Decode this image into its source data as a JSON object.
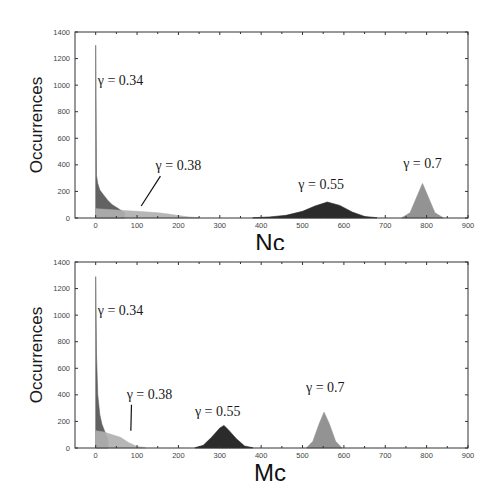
{
  "chart_data": [
    {
      "type": "area",
      "title": "",
      "xlabel": "Nc",
      "ylabel": "Occurrences",
      "xlim": [
        -50,
        900
      ],
      "ylim": [
        0,
        1400
      ],
      "xticks": [
        0,
        100,
        200,
        300,
        400,
        500,
        600,
        700,
        800,
        900
      ],
      "yticks": [
        0,
        200,
        400,
        600,
        800,
        1000,
        1200,
        1400
      ],
      "grid": false,
      "legend": "none",
      "series": [
        {
          "name": "γ = 0.34",
          "color": "#555555",
          "x": [
            0,
            2,
            5,
            10,
            20,
            30,
            40,
            50,
            60,
            70
          ],
          "values": [
            1300,
            320,
            260,
            210,
            170,
            130,
            100,
            80,
            60,
            40
          ]
        },
        {
          "name": "γ = 0.38",
          "color": "#b0b0b0",
          "x": [
            0,
            25,
            50,
            75,
            100,
            125,
            150,
            175,
            200,
            225,
            250
          ],
          "values": [
            70,
            65,
            60,
            55,
            50,
            45,
            40,
            30,
            18,
            8,
            2
          ]
        },
        {
          "name": "γ = 0.55",
          "color": "#1a1a1a",
          "x": [
            380,
            420,
            460,
            500,
            530,
            560,
            590,
            620,
            650,
            680
          ],
          "values": [
            2,
            8,
            20,
            50,
            90,
            120,
            95,
            45,
            12,
            2
          ]
        },
        {
          "name": "γ = 0.7",
          "color": "#8a8a8a",
          "x": [
            740,
            760,
            775,
            790,
            805,
            820,
            840
          ],
          "values": [
            2,
            40,
            150,
            260,
            150,
            40,
            2
          ]
        }
      ],
      "annotations": [
        {
          "text": "γ = 0.34",
          "x": 60,
          "y": 1000
        },
        {
          "text": "γ = 0.38",
          "x": 200,
          "y": 360,
          "arrow_to": [
            110,
            90
          ]
        },
        {
          "text": "γ = 0.55",
          "x": 545,
          "y": 220
        },
        {
          "text": "γ = 0.7",
          "x": 790,
          "y": 380
        }
      ]
    },
    {
      "type": "area",
      "title": "",
      "xlabel": "Mc",
      "ylabel": "Occurrences",
      "xlim": [
        -50,
        900
      ],
      "ylim": [
        0,
        1400
      ],
      "xticks": [
        0,
        100,
        200,
        300,
        400,
        500,
        600,
        700,
        800,
        900
      ],
      "yticks": [
        0,
        200,
        400,
        600,
        800,
        1000,
        1200,
        1400
      ],
      "grid": false,
      "legend": "none",
      "series": [
        {
          "name": "γ = 0.34",
          "color": "#555555",
          "x": [
            0,
            2,
            5,
            10,
            15,
            20,
            25,
            30
          ],
          "values": [
            1290,
            700,
            400,
            250,
            180,
            140,
            100,
            60
          ]
        },
        {
          "name": "γ = 0.38",
          "color": "#b0b0b0",
          "x": [
            0,
            20,
            40,
            60,
            80,
            100,
            120
          ],
          "values": [
            130,
            120,
            100,
            80,
            40,
            12,
            2
          ]
        },
        {
          "name": "γ = 0.55",
          "color": "#1a1a1a",
          "x": [
            240,
            260,
            280,
            300,
            310,
            320,
            340,
            360,
            380
          ],
          "values": [
            2,
            20,
            80,
            150,
            170,
            140,
            70,
            15,
            2
          ]
        },
        {
          "name": "γ = 0.7",
          "color": "#8a8a8a",
          "x": [
            510,
            525,
            540,
            552,
            565,
            580,
            595
          ],
          "values": [
            2,
            50,
            180,
            270,
            180,
            50,
            2
          ]
        }
      ],
      "annotations": [
        {
          "text": "γ = 0.34",
          "x": 60,
          "y": 1000
        },
        {
          "text": "γ = 0.38",
          "x": 130,
          "y": 370,
          "arrow_to": [
            85,
            130
          ]
        },
        {
          "text": "γ = 0.55",
          "x": 295,
          "y": 240
        },
        {
          "text": "γ = 0.7",
          "x": 555,
          "y": 420
        }
      ]
    }
  ],
  "panels": [
    {
      "ylabel": "Occurrences",
      "xlabel": "Nc"
    },
    {
      "ylabel": "Occurrences",
      "xlabel": "Mc"
    }
  ]
}
